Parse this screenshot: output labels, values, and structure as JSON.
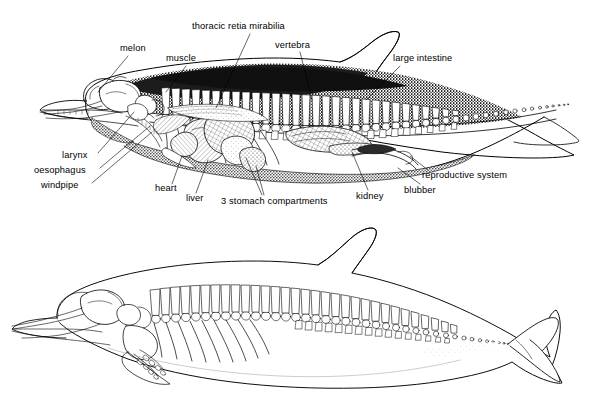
{
  "figure": {
    "title_present": false,
    "background_color": "#ffffff",
    "ink_color": "#000000",
    "panels": [
      {
        "name": "upper-cutaway-anatomy",
        "description": "sagittal cutaway of a dolphin showing internal organs, skeleton and blubber"
      },
      {
        "name": "lower-skeleton-outline",
        "description": "line outline of dolphin body with skeleton visible"
      }
    ]
  },
  "labels": [
    {
      "id": "melon",
      "text": "melon",
      "x": 120,
      "y": 48,
      "anchor": "start"
    },
    {
      "id": "muscle",
      "text": "muscle",
      "x": 166,
      "y": 58,
      "anchor": "start"
    },
    {
      "id": "thoracic_retia",
      "text": "thoracic retia mirabilia",
      "x": 192,
      "y": 26,
      "anchor": "start"
    },
    {
      "id": "vertebra",
      "text": "vertebra",
      "x": 275,
      "y": 45,
      "anchor": "start"
    },
    {
      "id": "large_intestine",
      "text": "large intestine",
      "x": 393,
      "y": 58,
      "anchor": "start"
    },
    {
      "id": "larynx",
      "text": "larynx",
      "x": 62,
      "y": 155,
      "anchor": "start"
    },
    {
      "id": "oesophagus",
      "text": "oesophagus",
      "x": 34,
      "y": 170,
      "anchor": "start"
    },
    {
      "id": "windpipe",
      "text": "windpipe",
      "x": 41,
      "y": 185,
      "anchor": "start"
    },
    {
      "id": "heart",
      "text": "heart",
      "x": 155,
      "y": 188,
      "anchor": "start"
    },
    {
      "id": "liver",
      "text": "liver",
      "x": 186,
      "y": 198,
      "anchor": "start"
    },
    {
      "id": "stomach",
      "text": "3 stomach compartments",
      "x": 221,
      "y": 201,
      "anchor": "start"
    },
    {
      "id": "kidney",
      "text": "kidney",
      "x": 356,
      "y": 196,
      "anchor": "start"
    },
    {
      "id": "blubber",
      "text": "blubber",
      "x": 404,
      "y": 190,
      "anchor": "start"
    },
    {
      "id": "reproductive",
      "text": "reproductive system",
      "x": 422,
      "y": 175,
      "anchor": "start"
    }
  ]
}
